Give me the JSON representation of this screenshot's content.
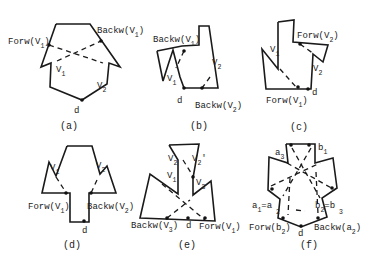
{
  "figure": {
    "panels": [
      {
        "id": "a",
        "caption": "(a)",
        "caption_pos": [
          60,
          129
        ],
        "polygon": [
          [
            56,
            24
          ],
          [
            90,
            24
          ],
          [
            120,
            67
          ],
          [
            109,
            63
          ],
          [
            107,
            84
          ],
          [
            82,
            100
          ],
          [
            50,
            87
          ],
          [
            51,
            63
          ],
          [
            41,
            67
          ],
          [
            56,
            24
          ]
        ],
        "dashed": [
          [
            [
              49,
              45
            ],
            [
              103,
              63
            ]
          ],
          [
            [
              57,
              61
            ],
            [
              101,
              41
            ]
          ]
        ],
        "dots": [
          [
            82,
            100
          ],
          [
            49,
            45
          ],
          [
            101,
            41
          ]
        ],
        "labels": [
          {
            "text": "Forw(",
            "v": "V",
            "sub": "1",
            "close": ")",
            "x": 8,
            "y": 44
          },
          {
            "text": "Backw(",
            "v": "V",
            "sub": "1",
            "close": ")",
            "x": 97,
            "y": 33
          },
          {
            "text": "",
            "v": "V",
            "sub": "1",
            "close": "",
            "x": 56,
            "y": 72
          },
          {
            "text": "",
            "v": "V",
            "sub": "2",
            "close": "",
            "x": 97,
            "y": 88
          },
          {
            "text": "d",
            "v": "",
            "sub": "",
            "close": "",
            "x": 74,
            "y": 113
          }
        ]
      },
      {
        "id": "b",
        "caption": "(b)",
        "caption_pos": [
          190,
          129
        ],
        "polygon": [
          [
            157,
            51
          ],
          [
            182,
            46
          ],
          [
            199,
            45
          ],
          [
            199,
            26
          ],
          [
            209,
            26
          ],
          [
            218,
            88
          ],
          [
            184,
            88
          ],
          [
            180,
            77
          ],
          [
            173,
            50
          ],
          [
            169,
            62
          ],
          [
            163,
            81
          ],
          [
            157,
            51
          ]
        ],
        "dashed": [
          [
            [
              184,
              51
            ],
            [
              176,
              68
            ]
          ],
          [
            [
              210,
              77
            ],
            [
              202,
              88
            ]
          ]
        ],
        "dots": [
          [
            184,
            88
          ],
          [
            184,
            51
          ],
          [
            202,
            88
          ]
        ],
        "labels": [
          {
            "text": "Backw(",
            "v": "V",
            "sub": "1",
            "close": ")",
            "x": 153,
            "y": 42
          },
          {
            "text": "",
            "v": "V",
            "sub": "1",
            "close": "",
            "x": 167,
            "y": 81
          },
          {
            "text": "",
            "v": "V",
            "sub": "2",
            "close": "",
            "x": 212,
            "y": 65
          },
          {
            "text": "d",
            "v": "",
            "sub": "",
            "close": "",
            "x": 177,
            "y": 103
          },
          {
            "text": "Backw(",
            "v": "V",
            "sub": "2",
            "close": ")",
            "x": 195,
            "y": 108
          }
        ]
      },
      {
        "id": "c",
        "caption": "(c)",
        "caption_pos": [
          290,
          130
        ],
        "polygon": [
          [
            278,
            22
          ],
          [
            294,
            20
          ],
          [
            293,
            42
          ],
          [
            328,
            45
          ],
          [
            323,
            62
          ],
          [
            313,
            54
          ],
          [
            311,
            89
          ],
          [
            266,
            89
          ],
          [
            262,
            49
          ],
          [
            278,
            69
          ],
          [
            278,
            22
          ]
        ],
        "dashed": [
          [
            [
              280,
              69
            ],
            [
              296,
              87
            ]
          ],
          [
            [
              300,
              44
            ],
            [
              314,
              54
            ]
          ]
        ],
        "dots": [
          [
            308,
            89
          ],
          [
            298,
            87
          ],
          [
            300,
            44
          ]
        ],
        "labels": [
          {
            "text": "Forw(",
            "v": "V",
            "sub": "2",
            "close": ")",
            "x": 297,
            "y": 38
          },
          {
            "text": "",
            "v": "V",
            "sub": "1",
            "close": "",
            "x": 270,
            "y": 52
          },
          {
            "text": "",
            "v": "V",
            "sub": "2",
            "close": "",
            "x": 313,
            "y": 71
          },
          {
            "text": "d",
            "v": "",
            "sub": "",
            "close": "",
            "x": 312,
            "y": 95
          },
          {
            "text": "Forw(",
            "v": "V",
            "sub": "1",
            "close": ")",
            "x": 266,
            "y": 103
          }
        ]
      },
      {
        "id": "d",
        "caption": "(d)",
        "caption_pos": [
          63,
          248
        ],
        "polygon": [
          [
            67,
            146
          ],
          [
            92,
            146
          ],
          [
            100,
            174
          ],
          [
            107,
            166
          ],
          [
            116,
            193
          ],
          [
            89,
            193
          ],
          [
            89,
            222
          ],
          [
            70,
            222
          ],
          [
            70,
            193
          ],
          [
            42,
            193
          ],
          [
            49,
            162
          ],
          [
            56,
            176
          ],
          [
            67,
            146
          ]
        ],
        "dashed": [
          [
            [
              56,
              177
            ],
            [
              67,
              194
            ]
          ],
          [
            [
              97,
              180
            ],
            [
              91,
              193
            ]
          ]
        ],
        "dots": [
          [
            84,
            221
          ],
          [
            66,
            193
          ],
          [
            91,
            193
          ]
        ],
        "labels": [
          {
            "text": "",
            "v": "V",
            "sub": "1",
            "close": "",
            "x": 50,
            "y": 170
          },
          {
            "text": "",
            "v": "V",
            "sub": "2",
            "close": "",
            "x": 96,
            "y": 168
          },
          {
            "text": "Forw(",
            "v": "V",
            "sub": "1",
            "close": ")",
            "x": 28,
            "y": 209
          },
          {
            "text": "Backw(",
            "v": "V",
            "sub": "2",
            "close": ")",
            "x": 87,
            "y": 209
          },
          {
            "text": "d",
            "v": "",
            "sub": "",
            "close": "",
            "x": 82,
            "y": 233
          }
        ]
      },
      {
        "id": "e",
        "caption": "(e)",
        "caption_pos": [
          178,
          248
        ],
        "polygon": [
          [
            169,
            145
          ],
          [
            199,
            144
          ],
          [
            193,
            178
          ],
          [
            193,
            195
          ],
          [
            211,
            181
          ],
          [
            215,
            221
          ],
          [
            140,
            218
          ],
          [
            150,
            174
          ],
          [
            178,
            194
          ],
          [
            178,
            160
          ],
          [
            169,
            145
          ]
        ],
        "dashed": [
          [
            [
              183,
              160
            ],
            [
              193,
              176
            ]
          ],
          [
            [
              162,
              184
            ],
            [
              205,
              220
            ]
          ],
          [
            [
              167,
              218
            ],
            [
              190,
              200
            ]
          ]
        ],
        "dots": [
          [
            193,
            177
          ],
          [
            188,
            218
          ],
          [
            205,
            218
          ],
          [
            167,
            218
          ]
        ],
        "labels": [
          {
            "text": "",
            "v": "V",
            "sub": "2",
            "close": "",
            "x": 168,
            "y": 161
          },
          {
            "text": "",
            "v": "V",
            "sub": "2",
            "close": "'",
            "x": 192,
            "y": 161
          },
          {
            "text": "",
            "v": "V",
            "sub": "1",
            "close": "",
            "x": 167,
            "y": 178
          },
          {
            "text": "",
            "v": "V",
            "sub": "3",
            "close": "",
            "x": 196,
            "y": 185
          },
          {
            "text": "Backw(",
            "v": "V",
            "sub": "3",
            "close": ")",
            "x": 131,
            "y": 228
          },
          {
            "text": "d",
            "v": "",
            "sub": "",
            "close": "",
            "x": 186,
            "y": 228
          },
          {
            "text": "Forw(",
            "v": "V",
            "sub": "1",
            "close": ")",
            "x": 199,
            "y": 229
          }
        ]
      },
      {
        "id": "f",
        "caption": "(f)",
        "caption_pos": [
          300,
          248
        ],
        "polygon": [
          [
            286,
            144
          ],
          [
            315,
            144
          ],
          [
            315,
            163
          ],
          [
            333,
            158
          ],
          [
            337,
            188
          ],
          [
            322,
            198
          ],
          [
            327,
            217
          ],
          [
            301,
            227
          ],
          [
            278,
            218
          ],
          [
            280,
            199
          ],
          [
            268,
            190
          ],
          [
            269,
            157
          ],
          [
            288,
            163
          ],
          [
            286,
            144
          ]
        ],
        "dashed": [
          [
            [
              292,
              148
            ],
            [
              320,
              198
            ]
          ],
          [
            [
              311,
              148
            ],
            [
              283,
              196
            ]
          ],
          [
            [
              271,
              186
            ],
            [
              320,
              163
            ]
          ],
          [
            [
              287,
              163
            ],
            [
              335,
              190
            ]
          ],
          [
            [
              290,
              178
            ],
            [
              288,
              215
            ]
          ],
          [
            [
              316,
              172
            ],
            [
              318,
              214
            ]
          ],
          [
            [
              296,
              210
            ],
            [
              305,
              211
            ]
          ]
        ],
        "dots": [
          [
            301,
            226
          ],
          [
            272,
            189
          ],
          [
            332,
            188
          ],
          [
            283,
            218
          ],
          [
            318,
            218
          ],
          [
            291,
            145
          ],
          [
            309,
            145
          ]
        ],
        "labels": [
          {
            "text": "",
            "v": "a",
            "sub": "3",
            "close": "",
            "x": 275,
            "y": 155
          },
          {
            "text": "",
            "v": "b",
            "sub": "1",
            "close": "",
            "x": 318,
            "y": 150
          },
          {
            "text": "",
            "v": "a",
            "sub": "1",
            "close": "=a",
            "x": 252,
            "y": 208
          },
          {
            "text": "",
            "v": "b",
            "sub": "2",
            "close": "=b",
            "x": 315,
            "y": 208
          },
          {
            "text": "Forw(",
            "v": "b",
            "sub": "2",
            "close": ")",
            "x": 249,
            "y": 230
          },
          {
            "text": "d",
            "v": "",
            "sub": "",
            "close": "",
            "x": 298,
            "y": 236
          },
          {
            "text": "Backw(",
            "v": "a",
            "sub": "2",
            "close": ")",
            "x": 314,
            "y": 230
          }
        ],
        "extra_subs": [
          {
            "text": "2",
            "x": 276,
            "y": 214
          },
          {
            "text": "3",
            "x": 339,
            "y": 214
          }
        ]
      }
    ]
  }
}
